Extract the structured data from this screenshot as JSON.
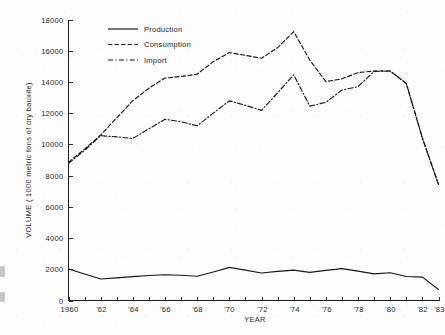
{
  "chart_data": {
    "type": "line",
    "title": "",
    "xlabel": "YEAR",
    "ylabel": "VOLUME ( 1000 metric tons of dry bauxite)",
    "xlim": [
      1960,
      1983
    ],
    "ylim": [
      0,
      18000
    ],
    "grid": false,
    "legend_position": "top-left",
    "x": [
      1960,
      1961,
      1962,
      1963,
      1964,
      1965,
      1966,
      1967,
      1968,
      1969,
      1970,
      1971,
      1972,
      1973,
      1974,
      1975,
      1976,
      1977,
      1978,
      1979,
      1980,
      1981,
      1982,
      1983
    ],
    "x_tick_labels": [
      "1960",
      "'62",
      "'64",
      "'66",
      "'68",
      "'70",
      "'72",
      "'74",
      "'76",
      "'78",
      "'80",
      "'82",
      "'83"
    ],
    "x_tick_values": [
      1960,
      1962,
      1964,
      1966,
      1968,
      1970,
      1972,
      1974,
      1976,
      1978,
      1980,
      1982,
      1983
    ],
    "y_tick_labels": [
      "0",
      "2000",
      "4000",
      "6000",
      "8000",
      "10000",
      "12000",
      "14000",
      "16000",
      "18000"
    ],
    "y_tick_values": [
      0,
      2000,
      4000,
      6000,
      8000,
      10000,
      12000,
      14000,
      16000,
      18000
    ],
    "series": [
      {
        "name": "Production",
        "style": "solid",
        "values": [
          2020,
          1700,
          1380,
          1450,
          1530,
          1600,
          1650,
          1620,
          1550,
          1830,
          2120,
          1950,
          1760,
          1870,
          1950,
          1800,
          1930,
          2040,
          1880,
          1710,
          1780,
          1540,
          1500,
          700
        ]
      },
      {
        "name": "Consumption",
        "style": "dashed",
        "values": [
          8850,
          9700,
          10600,
          11700,
          12800,
          13600,
          14250,
          14350,
          14500,
          15300,
          15880,
          15700,
          15520,
          16200,
          17220,
          15400,
          14020,
          14200,
          14600,
          14700,
          14700,
          13900,
          10400,
          7430
        ]
      },
      {
        "name": "Import",
        "style": "dashdot",
        "values": [
          8780,
          9620,
          10560,
          10480,
          10380,
          11000,
          11610,
          11450,
          11190,
          12000,
          12790,
          12500,
          12180,
          13300,
          14460,
          12450,
          12700,
          13480,
          13700,
          14680,
          14700,
          13900,
          10400,
          7430
        ]
      }
    ]
  },
  "legend": {
    "items": [
      {
        "label": "Production",
        "style": "solid"
      },
      {
        "label": "Consumption",
        "style": "dashed"
      },
      {
        "label": "Import",
        "style": "dashdot"
      }
    ]
  },
  "axes": {
    "y_title": "VOLUME ( 1000 metric tons of dry bauxite)",
    "x_title": "YEAR"
  },
  "colors": {
    "ink": "#17181a",
    "paper": "#fdfdfd"
  }
}
